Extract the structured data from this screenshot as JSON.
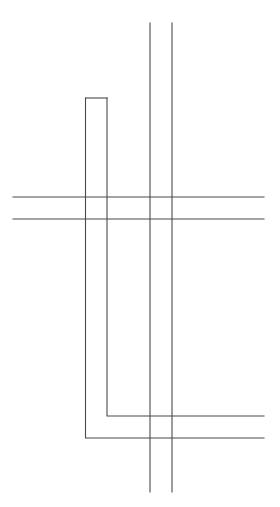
{
  "diagram": {
    "type": "line-drawing",
    "background": "#ffffff",
    "stroke_color": "#4a4a4a",
    "width": 280,
    "height": 507,
    "elements": [
      {
        "name": "vertical-line-left",
        "kind": "line",
        "x1": 150,
        "y1": 23,
        "x2": 150,
        "y2": 492
      },
      {
        "name": "vertical-line-right",
        "kind": "line",
        "x1": 172,
        "y1": 23,
        "x2": 172,
        "y2": 492
      },
      {
        "name": "horizontal-line-top",
        "kind": "line",
        "x1": 13,
        "y1": 197,
        "x2": 264,
        "y2": 197
      },
      {
        "name": "horizontal-line-bottom",
        "kind": "line",
        "x1": 13,
        "y1": 219,
        "x2": 264,
        "y2": 219
      },
      {
        "name": "l-shape-inner",
        "kind": "polyline",
        "points": "264,416 107,416 107,98"
      },
      {
        "name": "l-shape-outer",
        "kind": "polyline",
        "points": "85.5,98 85.5,438 264,438"
      },
      {
        "name": "l-shape-cap",
        "kind": "line",
        "x1": 85.5,
        "y1": 98,
        "x2": 107,
        "y2": 98
      }
    ]
  }
}
